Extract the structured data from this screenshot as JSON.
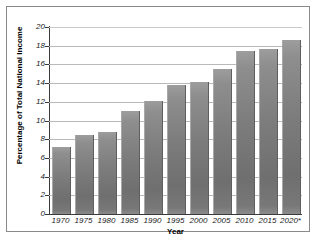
{
  "chart_data": {
    "type": "bar",
    "title": "",
    "xlabel": "Year",
    "ylabel": "Percentage of Total National Income",
    "categories": [
      "1970",
      "1975",
      "1980",
      "1985",
      "1990",
      "1995",
      "2000",
      "2005",
      "2010",
      "2015",
      "2020*"
    ],
    "values": [
      7.2,
      8.4,
      8.8,
      11.0,
      12.1,
      13.8,
      14.1,
      15.5,
      17.4,
      17.6,
      18.6
    ],
    "ylim": [
      0,
      20
    ],
    "ytick_labels": [
      "20",
      "18",
      "16",
      "14",
      "12",
      "10",
      "8",
      "6",
      "4",
      "2",
      "0"
    ],
    "ytick_values": [
      20,
      18,
      16,
      14,
      12,
      10,
      8,
      6,
      4,
      2,
      0
    ],
    "grid": true,
    "legend": "none",
    "bar_color": "#7c7c7c",
    "gridline_color": "#b9b9b9",
    "axis_color": "#3a3a3a",
    "background_color": "#ffffff",
    "footnote_marker": "*"
  }
}
